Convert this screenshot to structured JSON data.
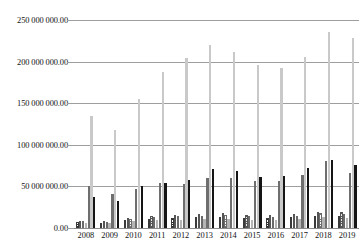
{
  "chart_data": {
    "type": "bar",
    "title": "",
    "subtitle": "",
    "xlabel": "",
    "ylabel": "",
    "grid": true,
    "legend_position": "none",
    "ylim": [
      0,
      250000000
    ],
    "ytick_labels": [
      "250 000 000.00",
      "200 000 000.00",
      "150 000 000.00",
      "100 000 000.00",
      "50 000 000.00",
      "0.00"
    ],
    "ytick_values": [
      250000000,
      200000000,
      150000000,
      100000000,
      50000000,
      0
    ],
    "categories": [
      "2008",
      "2009",
      "2010",
      "2011",
      "2012",
      "2013",
      "2014",
      "2015",
      "2016",
      "2017",
      "2018",
      "2019"
    ],
    "series": [
      {
        "name": "Series 1",
        "style": "s-hatch-a",
        "color": "#2b2b2b",
        "values": [
          7000000,
          6500000,
          9500000,
          11000000,
          12000000,
          13000000,
          13500000,
          12500000,
          12000000,
          13000000,
          15000000,
          14500000
        ]
      },
      {
        "name": "Series 2",
        "style": "s-hatch-b",
        "color": "#555555",
        "values": [
          9000000,
          8500000,
          12000000,
          14500000,
          15500000,
          17000000,
          17500000,
          16000000,
          15500000,
          17000000,
          19500000,
          19000000
        ]
      },
      {
        "name": "Series 3",
        "style": "s-hatch-c",
        "color": "#6a6a6a",
        "values": [
          8000000,
          7500000,
          11000000,
          13000000,
          14000000,
          15000000,
          15500000,
          14000000,
          13500000,
          15000000,
          17500000,
          17000000
        ]
      },
      {
        "name": "Series 4",
        "style": "s-grayflat",
        "color": "#b5b5b5",
        "values": [
          6000000,
          5500000,
          8000000,
          9500000,
          10000000,
          11000000,
          11000000,
          10000000,
          10000000,
          11000000,
          13000000,
          12500000
        ]
      },
      {
        "name": "Series 5",
        "style": "s-mid",
        "color": "#6e6e6e",
        "values": [
          51000000,
          41000000,
          47000000,
          54000000,
          53000000,
          60000000,
          60000000,
          57000000,
          57000000,
          64000000,
          80000000,
          66000000
        ]
      },
      {
        "name": "Series 6",
        "style": "s-light",
        "color": "#c9c9c9",
        "values": [
          135000000,
          118000000,
          155000000,
          188000000,
          204000000,
          220000000,
          212000000,
          196000000,
          192000000,
          205000000,
          235000000,
          228000000
        ]
      },
      {
        "name": "Series 7",
        "style": "s-dark",
        "color": "#151515",
        "values": [
          37000000,
          32000000,
          51000000,
          54000000,
          58000000,
          71000000,
          69000000,
          61000000,
          62000000,
          72000000,
          82000000,
          76000000
        ]
      }
    ]
  }
}
